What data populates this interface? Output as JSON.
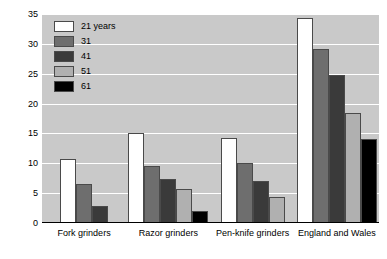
{
  "chart_data": {
    "type": "bar",
    "title": "",
    "subtitle": "",
    "xlabel": "",
    "ylabel": "",
    "categories": [
      "Fork grinders",
      "Razor grinders",
      "Pen-knife grinders",
      "England and Wales"
    ],
    "series": [
      {
        "name": "21 years",
        "color": "#ffffff",
        "values": [
          10.7,
          15.0,
          14.3,
          34.4
        ]
      },
      {
        "name": "31",
        "color": "#6e6e6e",
        "values": [
          6.6,
          9.6,
          10.0,
          29.2
        ]
      },
      {
        "name": "41",
        "color": "#3a3a3a",
        "values": [
          2.8,
          7.4,
          7.0,
          24.8
        ]
      },
      {
        "name": "51",
        "color": "#b0b0b0",
        "values": [
          null,
          5.7,
          4.3,
          18.4
        ]
      },
      {
        "name": "61",
        "color": "#000000",
        "values": [
          null,
          2.0,
          null,
          14.0
        ]
      }
    ],
    "ylim": [
      0,
      35
    ],
    "yticks": [
      "0",
      "5",
      "10",
      "15",
      "20",
      "25",
      "30",
      "35"
    ],
    "ytick_values": [
      0,
      5,
      10,
      15,
      20,
      25,
      30,
      35
    ],
    "grid": true,
    "legend_position": "top-left",
    "plot_background": "#c9c9c9",
    "gridline_color": "#ffffff",
    "bar_border_color": "#4a4a4a",
    "axis_color": "#000000"
  }
}
